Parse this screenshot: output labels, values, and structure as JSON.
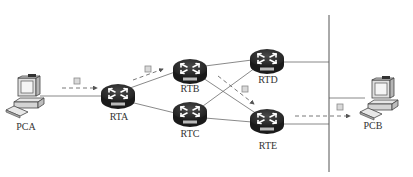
{
  "diagram": {
    "type": "network-topology",
    "nodes": [
      {
        "id": "PCA",
        "kind": "pc",
        "label": "PCA"
      },
      {
        "id": "RTA",
        "kind": "router",
        "label": "RTA",
        "badge": "ROUTER"
      },
      {
        "id": "RTB",
        "kind": "router",
        "label": "RTB",
        "badge": "ROUTER"
      },
      {
        "id": "RTC",
        "kind": "router",
        "label": "RTC",
        "badge": "ROUTER"
      },
      {
        "id": "RTD",
        "kind": "router",
        "label": "RTD",
        "badge": "ROUTER"
      },
      {
        "id": "RTE",
        "kind": "router",
        "label": "RTE",
        "badge": "ROUTER"
      },
      {
        "id": "PCB",
        "kind": "pc",
        "label": "PCB"
      }
    ],
    "links": [
      [
        "PCA",
        "RTA"
      ],
      [
        "RTA",
        "RTB"
      ],
      [
        "RTA",
        "RTC"
      ],
      [
        "RTB",
        "RTD"
      ],
      [
        "RTB",
        "RTE"
      ],
      [
        "RTC",
        "RTD"
      ],
      [
        "RTC",
        "RTE"
      ],
      [
        "RTD",
        "BUS"
      ],
      [
        "RTE",
        "BUS"
      ],
      [
        "BUS",
        "PCB"
      ]
    ],
    "packet_path": [
      "PCA",
      "RTA",
      "RTB",
      "RTE",
      "PCB"
    ],
    "colors": {
      "line": "#6b6b6b",
      "router_body": "#2b2b2b",
      "router_top": "#3a3a3a",
      "packet_fill": "#d9d9d9",
      "packet_stroke": "#8a8a8a",
      "label": "#333333"
    }
  }
}
